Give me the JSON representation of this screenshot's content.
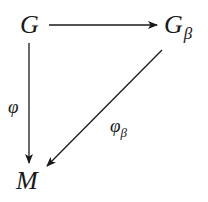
{
  "diagram": {
    "type": "commutative-diagram",
    "nodes": {
      "top_left": {
        "label": "G"
      },
      "top_right": {
        "label": "G",
        "subscript": "β"
      },
      "bottom_left": {
        "label": "M"
      }
    },
    "arrows": {
      "horizontal": {
        "from": "G",
        "to": "Gβ",
        "label": ""
      },
      "vertical": {
        "from": "G",
        "to": "M",
        "label": "φ"
      },
      "diagonal": {
        "from": "Gβ",
        "to": "M",
        "label": "φ",
        "label_subscript": "β"
      }
    },
    "colors": {
      "ink": "#1a1a1a",
      "background": "#ffffff"
    }
  }
}
